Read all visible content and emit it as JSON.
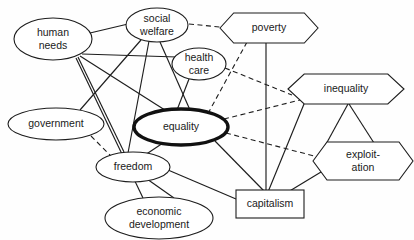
{
  "diagram": {
    "background_color": "#fefefe",
    "line_color": "#1d1d1d",
    "emphasis_color": "#111111",
    "focus_node": "equality",
    "nodes": [
      {
        "id": "human_needs",
        "label": "human\nneeds",
        "line1": "human",
        "line2": "needs",
        "shape": "ellipse",
        "cx": 53,
        "cy": 39,
        "rx": 39,
        "ry": 21,
        "emphasis": false
      },
      {
        "id": "social_welfare",
        "label": "social\nwelfare",
        "line1": "social",
        "line2": "welfare",
        "shape": "ellipse",
        "cx": 157,
        "cy": 25,
        "rx": 31,
        "ry": 17,
        "emphasis": false
      },
      {
        "id": "health_care",
        "label": "health\ncare",
        "line1": "health",
        "line2": "care",
        "shape": "ellipse",
        "cx": 199,
        "cy": 64,
        "rx": 27,
        "ry": 16,
        "emphasis": false
      },
      {
        "id": "poverty",
        "label": "poverty",
        "line1": "poverty",
        "line2": "",
        "shape": "hexagon",
        "cx": 269,
        "cy": 28,
        "rx": 49,
        "ry": 15,
        "emphasis": false
      },
      {
        "id": "inequality",
        "label": "inequality",
        "line1": "inequality",
        "line2": "",
        "shape": "hexagon",
        "cx": 346,
        "cy": 89,
        "rx": 58,
        "ry": 15,
        "emphasis": false
      },
      {
        "id": "equality",
        "label": "equality",
        "line1": "equality",
        "line2": "",
        "shape": "ellipse",
        "cx": 181,
        "cy": 127,
        "rx": 47,
        "ry": 18,
        "emphasis": true
      },
      {
        "id": "government",
        "label": "government",
        "line1": "government",
        "line2": "",
        "shape": "ellipse",
        "cx": 56,
        "cy": 124,
        "rx": 48,
        "ry": 16,
        "emphasis": false
      },
      {
        "id": "freedom",
        "label": "freedom",
        "line1": "freedom",
        "line2": "",
        "shape": "ellipse",
        "cx": 133,
        "cy": 167,
        "rx": 37,
        "ry": 15,
        "emphasis": false
      },
      {
        "id": "economic_development",
        "label": "economic\ndevelopment",
        "line1": "economic",
        "line2": "development",
        "shape": "ellipse",
        "cx": 159,
        "cy": 218,
        "rx": 54,
        "ry": 21,
        "emphasis": false
      },
      {
        "id": "capitalism",
        "label": "capitalism",
        "line1": "capitalism",
        "line2": "",
        "shape": "rectangle",
        "cx": 270,
        "cy": 204,
        "rx": 34,
        "ry": 14,
        "emphasis": false
      },
      {
        "id": "exploitation",
        "label": "exploit-\nation",
        "line1": "exploit-",
        "line2": "ation",
        "shape": "hexagon",
        "cx": 363,
        "cy": 161,
        "rx": 50,
        "ry": 19,
        "emphasis": false
      }
    ],
    "edges": [
      {
        "from": "human_needs",
        "to": "social_welfare",
        "style": "solid",
        "x1": 90,
        "y1": 33,
        "x2": 128,
        "y2": 24
      },
      {
        "from": "human_needs",
        "to": "health_care",
        "style": "solid",
        "x1": 82,
        "y1": 54,
        "x2": 177,
        "y2": 57
      },
      {
        "from": "human_needs",
        "to": "equality",
        "style": "solid",
        "x1": 80,
        "y1": 56,
        "x2": 168,
        "y2": 112
      },
      {
        "from": "human_needs",
        "to": "freedom",
        "style": "solid",
        "x1": 78,
        "y1": 57,
        "x2": 124,
        "y2": 152
      },
      {
        "from": "human_needs",
        "to": "economic_development",
        "style": "solid",
        "x1": 76,
        "y1": 58,
        "x2": 143,
        "y2": 198
      },
      {
        "from": "social_welfare",
        "to": "poverty",
        "style": "dashed",
        "x1": 189,
        "y1": 24,
        "x2": 220,
        "y2": 27
      },
      {
        "from": "social_welfare",
        "to": "government",
        "style": "solid",
        "x1": 141,
        "y1": 40,
        "x2": 80,
        "y2": 110
      },
      {
        "from": "social_welfare",
        "to": "equality",
        "style": "solid",
        "x1": 160,
        "y1": 42,
        "x2": 190,
        "y2": 110
      },
      {
        "from": "social_welfare",
        "to": "freedom",
        "style": "solid",
        "x1": 149,
        "y1": 41,
        "x2": 128,
        "y2": 153
      },
      {
        "from": "health_care",
        "to": "equality",
        "style": "solid",
        "x1": 189,
        "y1": 79,
        "x2": 177,
        "y2": 110
      },
      {
        "from": "health_care",
        "to": "inequality",
        "style": "dashed",
        "x1": 225,
        "y1": 68,
        "x2": 292,
        "y2": 95
      },
      {
        "from": "poverty",
        "to": "equality",
        "style": "dashed",
        "x1": 247,
        "y1": 42,
        "x2": 205,
        "y2": 119
      },
      {
        "from": "poverty",
        "to": "capitalism",
        "style": "solid",
        "x1": 266,
        "y1": 42,
        "x2": 266,
        "y2": 191
      },
      {
        "from": "equality",
        "to": "inequality",
        "style": "dashed",
        "x1": 224,
        "y1": 119,
        "x2": 300,
        "y2": 100
      },
      {
        "from": "equality",
        "to": "exploitation",
        "style": "dashed",
        "x1": 226,
        "y1": 133,
        "x2": 318,
        "y2": 157
      },
      {
        "from": "equality",
        "to": "freedom",
        "style": "solid",
        "x1": 163,
        "y1": 143,
        "x2": 145,
        "y2": 155
      },
      {
        "from": "equality",
        "to": "capitalism",
        "style": "solid",
        "x1": 215,
        "y1": 141,
        "x2": 264,
        "y2": 191
      },
      {
        "from": "government",
        "to": "freedom",
        "style": "dashed",
        "x1": 91,
        "y1": 136,
        "x2": 113,
        "y2": 158
      },
      {
        "from": "freedom",
        "to": "economic_development",
        "style": "solid",
        "x1": 147,
        "y1": 179,
        "x2": 174,
        "y2": 198
      },
      {
        "from": "freedom",
        "to": "capitalism",
        "style": "solid",
        "x1": 168,
        "y1": 170,
        "x2": 236,
        "y2": 199
      },
      {
        "from": "inequality",
        "to": "capitalism",
        "style": "solid",
        "x1": 304,
        "y1": 104,
        "x2": 268,
        "y2": 192
      },
      {
        "from": "inequality",
        "to": "exploitation",
        "style": "solid",
        "x1": 348,
        "y1": 104,
        "x2": 325,
        "y2": 146
      },
      {
        "from": "inequality",
        "to": "exploitation_right",
        "style": "solid",
        "x1": 349,
        "y1": 104,
        "x2": 374,
        "y2": 143
      },
      {
        "from": "exploitation",
        "to": "capitalism",
        "style": "solid",
        "x1": 321,
        "y1": 172,
        "x2": 288,
        "y2": 192
      }
    ]
  }
}
